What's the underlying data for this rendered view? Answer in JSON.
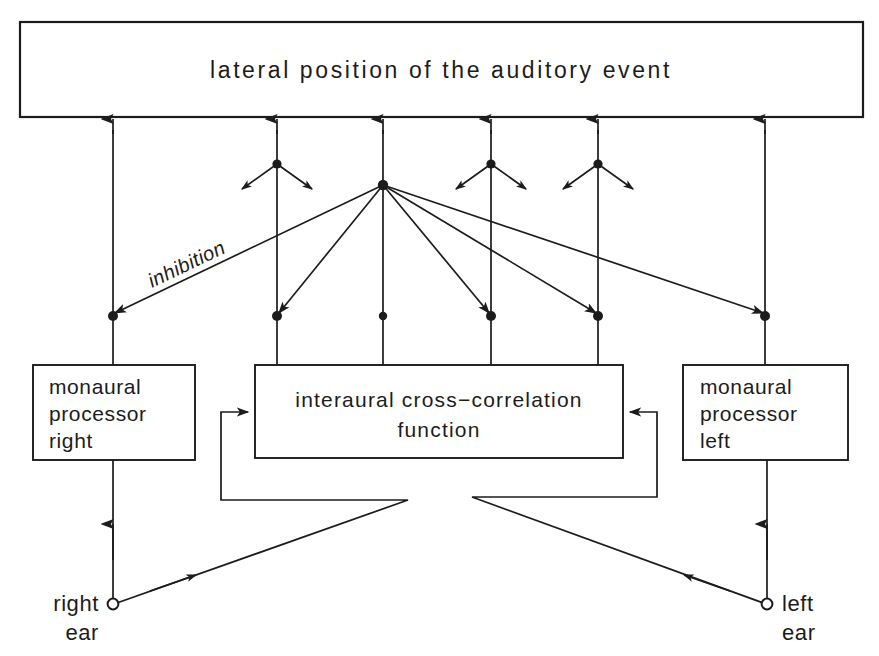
{
  "diagram": {
    "title_box": {
      "label": "lateral position of the auditory event"
    },
    "processor_right": {
      "line1": "monaural",
      "line2": "processor",
      "line3": "right"
    },
    "processor_left": {
      "line1": "monaural",
      "line2": "processor",
      "line3": "left"
    },
    "correlator": {
      "line1": "interaural  cross−correlation",
      "line2": "function"
    },
    "inhibition_label": "inhibition",
    "ear_right": {
      "line1": "right",
      "line2": "ear"
    },
    "ear_left": {
      "line1": "left",
      "line2": "ear"
    },
    "colors": {
      "ink": "#1c1c1c",
      "paper": "#ffffff"
    }
  }
}
